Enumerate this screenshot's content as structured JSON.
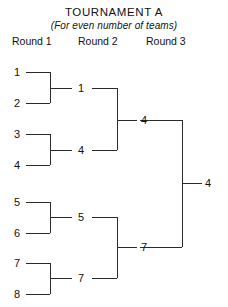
{
  "header": {
    "title": "TOURNAMENT  A",
    "subtitle": "(For even number of teams)"
  },
  "rounds": [
    {
      "label": "Round 1"
    },
    {
      "label": "Round 2"
    },
    {
      "label": "Round 3"
    }
  ],
  "seeds": [
    {
      "label": "1"
    },
    {
      "label": "2"
    },
    {
      "label": "3"
    },
    {
      "label": "4"
    },
    {
      "label": "5"
    },
    {
      "label": "6"
    },
    {
      "label": "7"
    },
    {
      "label": "8"
    }
  ],
  "round2_winners": [
    {
      "label": "1"
    },
    {
      "label": "4"
    },
    {
      "label": "5"
    },
    {
      "label": "7"
    }
  ],
  "round3_winners": [
    {
      "label": "4"
    },
    {
      "label": "7"
    }
  ],
  "champion": {
    "label": "4"
  },
  "colors": {
    "background": "#ffffff",
    "line": "#2b2b2b",
    "text": "#111111"
  }
}
